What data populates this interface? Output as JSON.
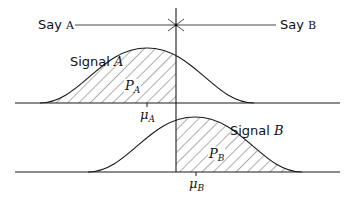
{
  "diagram": {
    "say_a": {
      "word": "Say",
      "letter": "A"
    },
    "say_b": {
      "word": "Say",
      "letter": "B"
    },
    "signal_a": {
      "word": "Signal",
      "letter": "A"
    },
    "signal_b": {
      "word": "Signal",
      "letter": "B"
    },
    "region_a": {
      "symbol": "P",
      "sub": "A"
    },
    "region_b": {
      "symbol": "P",
      "sub": "B"
    },
    "mean_a": {
      "symbol": "μ",
      "sub": "A"
    },
    "mean_b": {
      "symbol": "μ",
      "sub": "B"
    }
  },
  "colors": {
    "line": "#1a1a1a",
    "hatch": "#333333",
    "background": "#ffffff"
  }
}
